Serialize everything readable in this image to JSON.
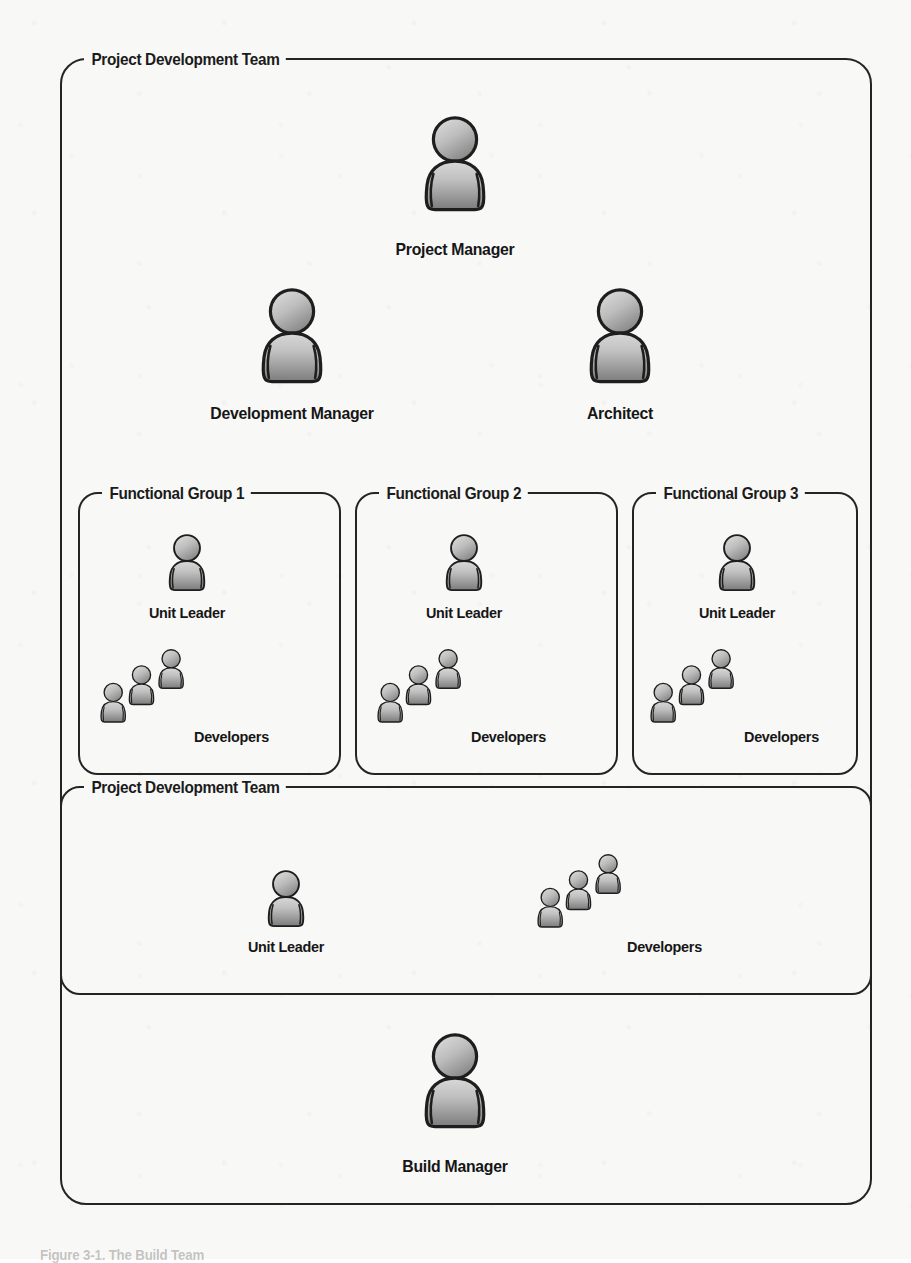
{
  "diagram": {
    "type": "organization-chart",
    "background_color": "#f8f8f7",
    "line_color": "#242424",
    "text_color": "#161616",
    "icon_gradient": {
      "top": "#d2d2d2",
      "bottom": "#7f7f7f",
      "outline": "#1e1e1e"
    }
  },
  "outer_box": {
    "label": "Project Development Team"
  },
  "top_roles": [
    {
      "label": "Project Manager",
      "icon": "person-icon",
      "size": "large"
    },
    {
      "label": "Development Manager",
      "icon": "person-icon",
      "size": "large"
    },
    {
      "label": "Architect",
      "icon": "person-icon",
      "size": "large"
    }
  ],
  "functional_groups": [
    {
      "label": "Functional Group 1",
      "leader": {
        "label": "Unit Leader",
        "icon": "person-icon"
      },
      "developers": {
        "label": "Developers",
        "icon": "people-group-icon",
        "count": 3
      }
    },
    {
      "label": "Functional Group 2",
      "leader": {
        "label": "Unit Leader",
        "icon": "person-icon"
      },
      "developers": {
        "label": "Developers",
        "icon": "people-group-icon",
        "count": 3
      }
    },
    {
      "label": "Functional Group 3",
      "leader": {
        "label": "Unit Leader",
        "icon": "person-icon"
      },
      "developers": {
        "label": "Developers",
        "icon": "people-group-icon",
        "count": 3
      }
    }
  ],
  "inner_team_box": {
    "label": "Project Development Team",
    "leader": {
      "label": "Unit Leader",
      "icon": "person-icon"
    },
    "developers": {
      "label": "Developers",
      "icon": "people-group-icon",
      "count": 3
    }
  },
  "bottom_role": {
    "label": "Build Manager",
    "icon": "person-icon",
    "size": "large"
  },
  "page_caption": {
    "text": "Figure 3-1. The Build Team"
  }
}
